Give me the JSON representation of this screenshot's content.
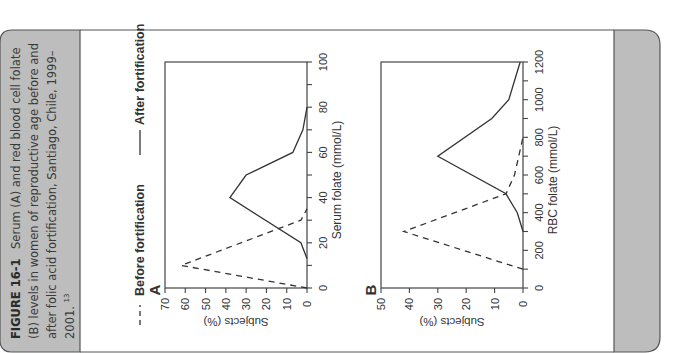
{
  "caption": {
    "label": "FIGURE 16-1",
    "lines": [
      "Serum (A) and red blood cell folate",
      "(B) levels in women of reproductive age before and",
      "after folic acid fortification, Santiago, Chile, 1999–",
      "2001."
    ],
    "superscript": "13"
  },
  "legend": {
    "before_label": "Before fortification",
    "after_label": "After fortification"
  },
  "colors": {
    "panel_gray": "#bdbdbd",
    "frame_line": "#555555",
    "series_line": "#333333"
  },
  "chart_data": [
    {
      "panel": "A",
      "type": "line",
      "title": "",
      "xlabel": "Serum folate (mmol/L)",
      "ylabel": "Subjects (%)",
      "xlim": [
        0,
        100
      ],
      "ylim": [
        0,
        70
      ],
      "xticks": [
        0,
        20,
        40,
        60,
        80,
        100
      ],
      "yticks": [
        0,
        10,
        20,
        30,
        40,
        50,
        60,
        70
      ],
      "grid": false,
      "legend_position": "top",
      "series": [
        {
          "name": "Before fortification",
          "style": "dashed",
          "x": [
            0,
            10,
            30,
            35
          ],
          "values": [
            0,
            62,
            3,
            0
          ]
        },
        {
          "name": "After fortification",
          "style": "solid",
          "x": [
            13,
            20,
            40,
            50,
            60,
            70,
            80
          ],
          "values": [
            0,
            3,
            38,
            30,
            7,
            2,
            0
          ]
        }
      ]
    },
    {
      "panel": "B",
      "type": "line",
      "title": "",
      "xlabel": "RBC folate (mmol/L)",
      "ylabel": "Subjects (%)",
      "xlim": [
        0,
        1200
      ],
      "ylim": [
        0,
        50
      ],
      "xticks": [
        0,
        200,
        400,
        600,
        800,
        1000,
        1200
      ],
      "yticks": [
        0,
        10,
        20,
        30,
        40,
        50
      ],
      "grid": false,
      "series": [
        {
          "name": "Before fortification",
          "style": "dashed",
          "x": [
            100,
            300,
            500,
            600,
            800
          ],
          "values": [
            0,
            42,
            6,
            3,
            0
          ]
        },
        {
          "name": "After fortification",
          "style": "solid",
          "x": [
            300,
            400,
            500,
            700,
            900,
            1000,
            1100,
            1200
          ],
          "values": [
            0,
            2,
            6,
            30,
            11,
            5,
            3,
            1
          ]
        }
      ]
    }
  ]
}
